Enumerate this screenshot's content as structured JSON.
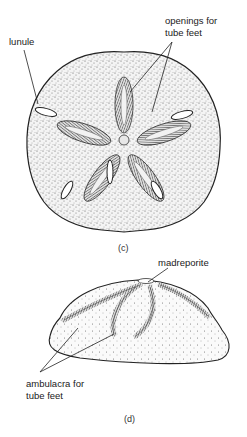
{
  "figure_c": {
    "caption": "(c)",
    "labels": {
      "lunule": "lunule",
      "openings_line1": "openings for",
      "openings_line2": "tube feet"
    },
    "view": "aboral (top) view of sand dollar"
  },
  "figure_d": {
    "caption": "(d)",
    "labels": {
      "madreporite": "madreporite",
      "ambulacra_line1": "ambulacra for",
      "ambulacra_line2": "tube feet"
    },
    "view": "side view of sand dollar"
  },
  "colors": {
    "ink": "#1a1a1a",
    "stipple": "#555555",
    "background": "#ffffff"
  }
}
